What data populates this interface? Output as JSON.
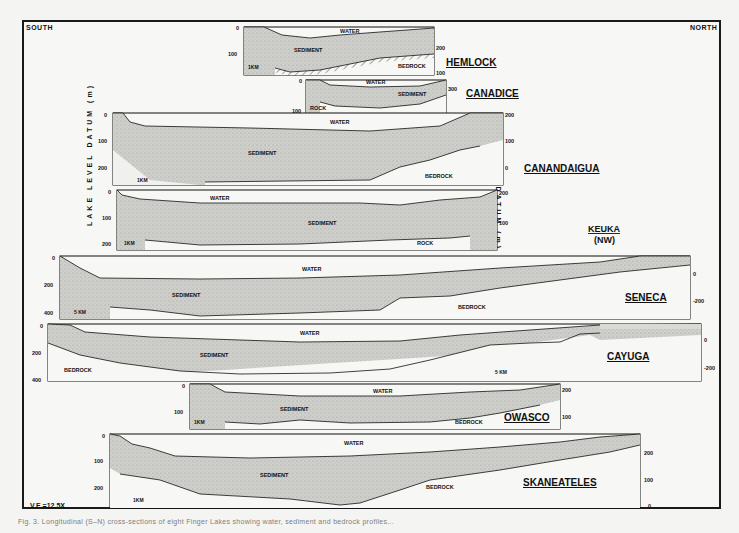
{
  "figure": {
    "orientation_left": "SOUTH",
    "orientation_right": "NORTH",
    "vertical_exaggeration": "V.E.=12.5X",
    "left_axis_title": "LAKE LEVEL DATUM (m)",
    "right_axis_title": "SEA LEVEL DATUM (m)",
    "caption": "Fig. 3. Longitudinal (S–N) cross-sections of eight Finger Lakes showing water, sediment and bedrock profiles..."
  },
  "labels": {
    "water": "WATER",
    "sediment": "SEDIMENT",
    "bedrock": "BEDROCK",
    "rock": "ROCK"
  },
  "lakes": [
    {
      "name": "HEMLOCK",
      "scale_bar": "1KM",
      "left_ticks": [
        "0",
        "100"
      ],
      "right_ticks": [
        "200",
        "100"
      ]
    },
    {
      "name": "CANADICE",
      "scale_bar": "",
      "left_ticks": [
        "0",
        "100"
      ],
      "right_ticks": [
        "300"
      ]
    },
    {
      "name": "CANANDAIGUA",
      "scale_bar": "1KM",
      "left_ticks": [
        "0",
        "100",
        "200"
      ],
      "right_ticks": [
        "200",
        "100",
        "0"
      ]
    },
    {
      "name": "KEUKA",
      "subname": "(NW)",
      "scale_bar": "1KM",
      "left_ticks": [
        "0",
        "100",
        "200"
      ],
      "right_ticks": [
        "200",
        "100"
      ]
    },
    {
      "name": "SENECA",
      "scale_bar": "5 KM",
      "left_ticks": [
        "0",
        "200",
        "400"
      ],
      "right_ticks": [
        "0",
        "-200"
      ]
    },
    {
      "name": "CAYUGA",
      "scale_bar": "5 KM",
      "left_ticks": [
        "0",
        "200",
        "400"
      ],
      "right_ticks": [
        "0",
        "-200"
      ]
    },
    {
      "name": "OWASCO",
      "scale_bar": "1KM",
      "left_ticks": [
        "0",
        "100"
      ],
      "right_ticks": [
        "200",
        "100"
      ]
    },
    {
      "name": "SKANEATELES",
      "scale_bar": "1KM",
      "left_ticks": [
        "0",
        "100",
        "200"
      ],
      "right_ticks": [
        "200",
        "100",
        "0"
      ]
    }
  ],
  "colors": {
    "line": "#1a1a1a",
    "sediment": "#c9c9c6",
    "water": "#f7f7f5",
    "paper": "#f4f4f2"
  }
}
